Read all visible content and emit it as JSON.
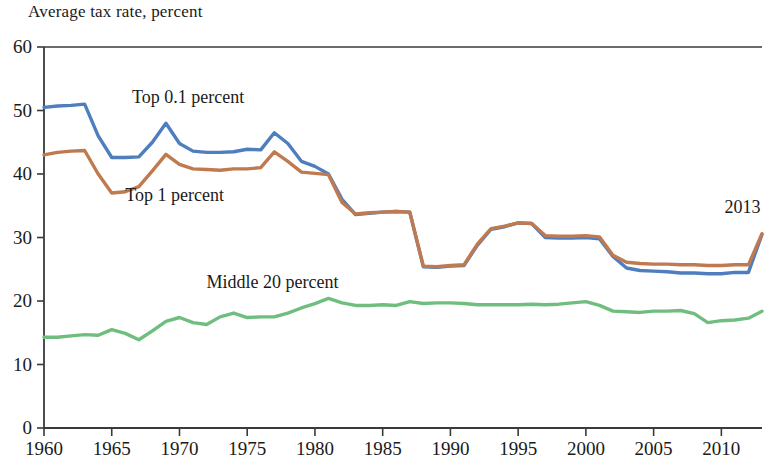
{
  "chart_data": {
    "type": "line",
    "title": "Average tax rate, percent",
    "xlabel": "",
    "ylabel": "Average tax rate, percent",
    "xlim": [
      1960,
      2013
    ],
    "ylim": [
      0,
      60
    ],
    "y_ticks": [
      0,
      10,
      20,
      30,
      40,
      50,
      60
    ],
    "x_ticks": [
      1960,
      1965,
      1970,
      1975,
      1980,
      1985,
      1990,
      1995,
      2000,
      2005,
      2010
    ],
    "grid": false,
    "legend": "inline-labels",
    "annotations": [
      {
        "text": "2013",
        "x": 2012,
        "y": 34.5
      }
    ],
    "x": [
      1960,
      1961,
      1962,
      1963,
      1964,
      1965,
      1966,
      1967,
      1968,
      1969,
      1970,
      1971,
      1972,
      1973,
      1974,
      1975,
      1976,
      1977,
      1978,
      1979,
      1980,
      1981,
      1982,
      1983,
      1984,
      1985,
      1986,
      1987,
      1988,
      1989,
      1990,
      1991,
      1992,
      1993,
      1994,
      1995,
      1996,
      1997,
      1998,
      1999,
      2000,
      2001,
      2002,
      2003,
      2004,
      2005,
      2006,
      2007,
      2008,
      2009,
      2010,
      2011,
      2012,
      2013
    ],
    "series": [
      {
        "name": "Top 0.1 percent",
        "color": "#4E7EBD",
        "label_x": 1966.5,
        "label_y": 52.0,
        "values": [
          50.5,
          50.7,
          50.8,
          51.0,
          46.0,
          42.6,
          42.6,
          42.7,
          45.0,
          48.0,
          44.8,
          43.6,
          43.4,
          43.4,
          43.5,
          43.9,
          43.8,
          46.5,
          44.8,
          42.0,
          41.2,
          40.0,
          36.0,
          33.6,
          33.8,
          34.0,
          34.1,
          34.0,
          25.4,
          25.3,
          25.5,
          25.6,
          28.8,
          31.3,
          31.7,
          32.3,
          32.2,
          30.0,
          29.9,
          29.9,
          30.0,
          29.8,
          27.0,
          25.2,
          24.8,
          24.7,
          24.6,
          24.4,
          24.4,
          24.3,
          24.3,
          24.5,
          24.5,
          30.5
        ]
      },
      {
        "name": "Top 1 percent",
        "color": "#BF7A4F",
        "label_x": 1966.0,
        "label_y": 36.5,
        "values": [
          43.0,
          43.4,
          43.6,
          43.7,
          40.0,
          37.0,
          37.2,
          38.0,
          40.5,
          43.1,
          41.5,
          40.8,
          40.7,
          40.6,
          40.8,
          40.8,
          41.0,
          43.5,
          42.0,
          40.3,
          40.1,
          39.9,
          35.5,
          33.7,
          33.9,
          34.0,
          34.1,
          34.0,
          25.5,
          25.4,
          25.6,
          25.7,
          29.0,
          31.4,
          31.8,
          32.3,
          32.2,
          30.3,
          30.2,
          30.2,
          30.3,
          30.1,
          27.2,
          26.1,
          25.9,
          25.8,
          25.8,
          25.7,
          25.7,
          25.6,
          25.6,
          25.7,
          25.7,
          30.6
        ]
      },
      {
        "name": "Middle 20 percent",
        "color": "#6FBE7F",
        "label_x": 1972.0,
        "label_y": 22.8,
        "values": [
          14.3,
          14.3,
          14.5,
          14.7,
          14.6,
          15.5,
          14.9,
          13.9,
          15.3,
          16.8,
          17.4,
          16.6,
          16.3,
          17.5,
          18.1,
          17.4,
          17.5,
          17.5,
          18.1,
          18.9,
          19.6,
          20.4,
          19.7,
          19.3,
          19.3,
          19.4,
          19.3,
          19.9,
          19.6,
          19.7,
          19.7,
          19.6,
          19.4,
          19.4,
          19.4,
          19.4,
          19.5,
          19.4,
          19.5,
          19.7,
          19.9,
          19.3,
          18.4,
          18.3,
          18.2,
          18.4,
          18.4,
          18.5,
          18.0,
          16.6,
          16.9,
          17.0,
          17.3,
          18.4
        ]
      }
    ]
  }
}
